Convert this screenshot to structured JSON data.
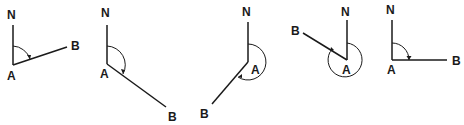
{
  "figure": {
    "diagrams": [
      {
        "id": "d1",
        "labels": {
          "north": "N",
          "origin": "A",
          "target": "B"
        },
        "bearing_direction": "north-east (acute)"
      },
      {
        "id": "d2",
        "labels": {
          "north": "N",
          "origin": "A",
          "target": "B"
        },
        "bearing_direction": "south-east (obtuse)"
      },
      {
        "id": "d3",
        "labels": {
          "north": "N",
          "origin": "A",
          "target": "B"
        },
        "bearing_direction": "south-west (reflex)"
      },
      {
        "id": "d4",
        "labels": {
          "north": "N",
          "origin": "A",
          "target": "B"
        },
        "bearing_direction": "north-west (reflex)"
      },
      {
        "id": "d5",
        "labels": {
          "north": "N",
          "origin": "A",
          "target": "B"
        },
        "bearing_direction": "east (right angle)"
      }
    ]
  }
}
